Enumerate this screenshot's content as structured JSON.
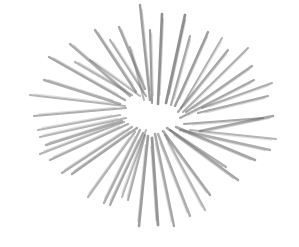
{
  "image": {
    "description": "Pencil sketch of a radial burst of strokes",
    "width": 299,
    "height": 247,
    "background": "#ffffff",
    "stroke_color": "#6b6b6b",
    "center": [
      152,
      116
    ],
    "strokes": [
      [
        158,
        104,
        162,
        14,
        2.6,
        0.75
      ],
      [
        152,
        103,
        150,
        30,
        2.2,
        0.65
      ],
      [
        166,
        103,
        185,
        15,
        2.8,
        0.75
      ],
      [
        171,
        105,
        190,
        36,
        2.2,
        0.6
      ],
      [
        175,
        106,
        208,
        32,
        2.4,
        0.65
      ],
      [
        181,
        108,
        222,
        38,
        1.8,
        0.55
      ],
      [
        178,
        112,
        228,
        50,
        2.2,
        0.6
      ],
      [
        183,
        112,
        248,
        48,
        2.0,
        0.55
      ],
      [
        186,
        112,
        252,
        66,
        2.2,
        0.6
      ],
      [
        180,
        118,
        254,
        80,
        2.0,
        0.6
      ],
      [
        198,
        113,
        268,
        96,
        2.2,
        0.6
      ],
      [
        202,
        108,
        272,
        83,
        2.0,
        0.55
      ],
      [
        184,
        124,
        263,
        118,
        2.2,
        0.6
      ],
      [
        200,
        131,
        273,
        116,
        2.4,
        0.6
      ],
      [
        180,
        130,
        270,
        150,
        2.4,
        0.55
      ],
      [
        190,
        130,
        276,
        139,
        2.0,
        0.5
      ],
      [
        176,
        127,
        255,
        160,
        2.6,
        0.6
      ],
      [
        170,
        130,
        226,
        167,
        2.2,
        0.55
      ],
      [
        167,
        128,
        238,
        180,
        2.6,
        0.6
      ],
      [
        163,
        131,
        210,
        195,
        2.4,
        0.6
      ],
      [
        165,
        135,
        205,
        210,
        2.2,
        0.5
      ],
      [
        158,
        134,
        190,
        216,
        2.4,
        0.55
      ],
      [
        155,
        134,
        174,
        226,
        2.4,
        0.6
      ],
      [
        152,
        138,
        158,
        225,
        2.8,
        0.7
      ],
      [
        148,
        136,
        139,
        226,
        2.6,
        0.65
      ],
      [
        145,
        135,
        128,
        200,
        2.2,
        0.55
      ],
      [
        146,
        130,
        122,
        197,
        2.0,
        0.5
      ],
      [
        143,
        133,
        110,
        205,
        2.2,
        0.6
      ],
      [
        140,
        130,
        104,
        203,
        2.4,
        0.55
      ],
      [
        135,
        132,
        88,
        197,
        2.2,
        0.5
      ],
      [
        137,
        128,
        72,
        174,
        2.4,
        0.6
      ],
      [
        132,
        127,
        62,
        173,
        2.2,
        0.55
      ],
      [
        128,
        124,
        50,
        160,
        2.4,
        0.55
      ],
      [
        124,
        122,
        40,
        154,
        2.2,
        0.5
      ],
      [
        122,
        121,
        46,
        145,
        2.4,
        0.55
      ],
      [
        126,
        118,
        40,
        137,
        2.2,
        0.5
      ],
      [
        120,
        115,
        38,
        130,
        2.0,
        0.5
      ],
      [
        126,
        108,
        34,
        116,
        2.2,
        0.55
      ],
      [
        125,
        106,
        30,
        95,
        2.0,
        0.5
      ],
      [
        120,
        104,
        44,
        80,
        2.4,
        0.55
      ],
      [
        125,
        100,
        49,
        57,
        2.4,
        0.6
      ],
      [
        130,
        96,
        70,
        44,
        2.4,
        0.55
      ],
      [
        132,
        95,
        75,
        62,
        2.2,
        0.5
      ],
      [
        136,
        92,
        95,
        30,
        2.4,
        0.6
      ],
      [
        140,
        96,
        90,
        60,
        2.0,
        0.5
      ],
      [
        145,
        89,
        119,
        27,
        2.4,
        0.6
      ],
      [
        146,
        96,
        110,
        40,
        2.2,
        0.55
      ],
      [
        150,
        100,
        140,
        5,
        2.4,
        0.65
      ],
      [
        144,
        100,
        130,
        47,
        2.0,
        0.5
      ]
    ]
  }
}
